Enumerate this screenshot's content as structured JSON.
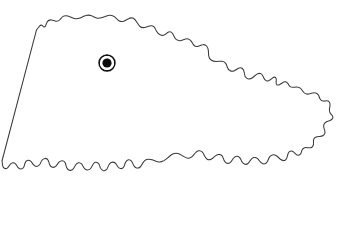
{
  "figure": {
    "type": "outline-map",
    "background_color": "#ffffff",
    "outline_color": "#3b3b3b",
    "outline_width_px": 1,
    "fill_color": "#ffffff",
    "width_px": 337,
    "height_px": 233,
    "labels": [],
    "title": "",
    "caption": ""
  },
  "marker": {
    "name": "location-marker",
    "shape": "ringed-dot",
    "label": "",
    "center_x_px": 107,
    "center_y_px": 63,
    "outer_ring_radius_px": 8,
    "dot_radius_px": 4.6,
    "ring_color": "#111111",
    "dot_color": "#0b0b0b",
    "halo_color": "#ffffff"
  }
}
